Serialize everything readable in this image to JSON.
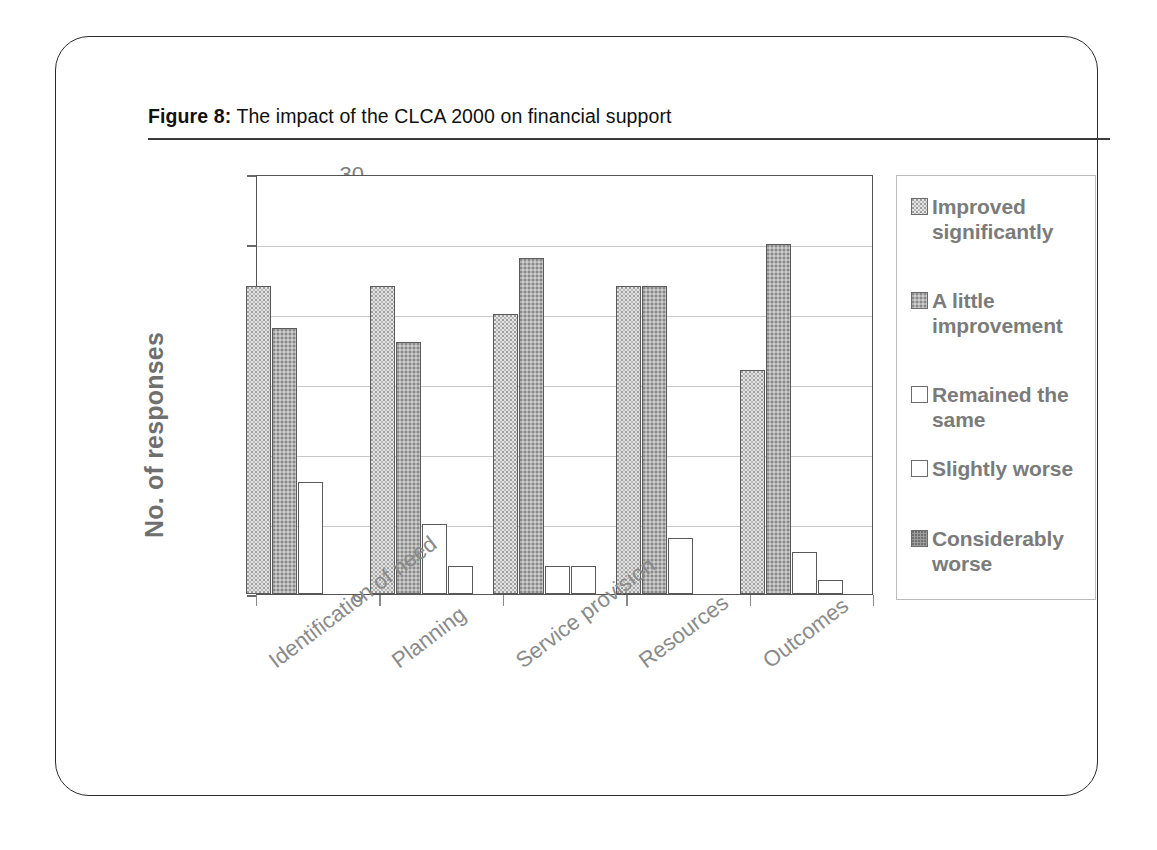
{
  "figure": {
    "label": "Figure 8:",
    "caption": " The impact of the CLCA 2000 on financial support"
  },
  "chart_data": {
    "type": "bar",
    "title": "The impact of the CLCA 2000 on financial support",
    "xlabel": "",
    "ylabel": "No. of responses",
    "ylim": [
      0,
      30
    ],
    "yticks": [
      0,
      5,
      10,
      15,
      20,
      25,
      30
    ],
    "grid": true,
    "legend_position": "right",
    "categories": [
      "Identification of need",
      "Planning",
      "Service provision",
      "Resources",
      "Outcomes"
    ],
    "series": [
      {
        "name": "Improved significantly",
        "color": "#e4e4e4",
        "values": [
          22,
          22,
          20,
          22,
          16
        ]
      },
      {
        "name": "A little improvement",
        "color": "#b1b1b1",
        "values": [
          19,
          18,
          24,
          22,
          25
        ]
      },
      {
        "name": "Remained the same",
        "color": "#ffffff",
        "values": [
          8,
          5,
          2,
          4,
          3
        ]
      },
      {
        "name": "Slightly worse",
        "color": "#ffffff",
        "values": [
          0,
          2,
          2,
          0,
          1
        ]
      },
      {
        "name": "Considerably worse",
        "color": "#9c9c9c",
        "values": [
          0,
          0,
          0,
          0,
          0
        ]
      }
    ]
  },
  "axis": {
    "y_title": "No. of responses",
    "y_tick_labels": [
      "30",
      "25",
      "20",
      "15",
      "10",
      "5",
      "0"
    ]
  },
  "legend": {
    "items": [
      {
        "label": "Improved significantly",
        "swatch": "fill-improved"
      },
      {
        "label": "A little improvement",
        "swatch": "fill-little"
      },
      {
        "label": "Remained the same",
        "swatch": "fill-remained"
      },
      {
        "label": "Slightly worse",
        "swatch": "fill-slightly"
      },
      {
        "label": "Considerably worse",
        "swatch": "fill-considerably"
      }
    ]
  }
}
